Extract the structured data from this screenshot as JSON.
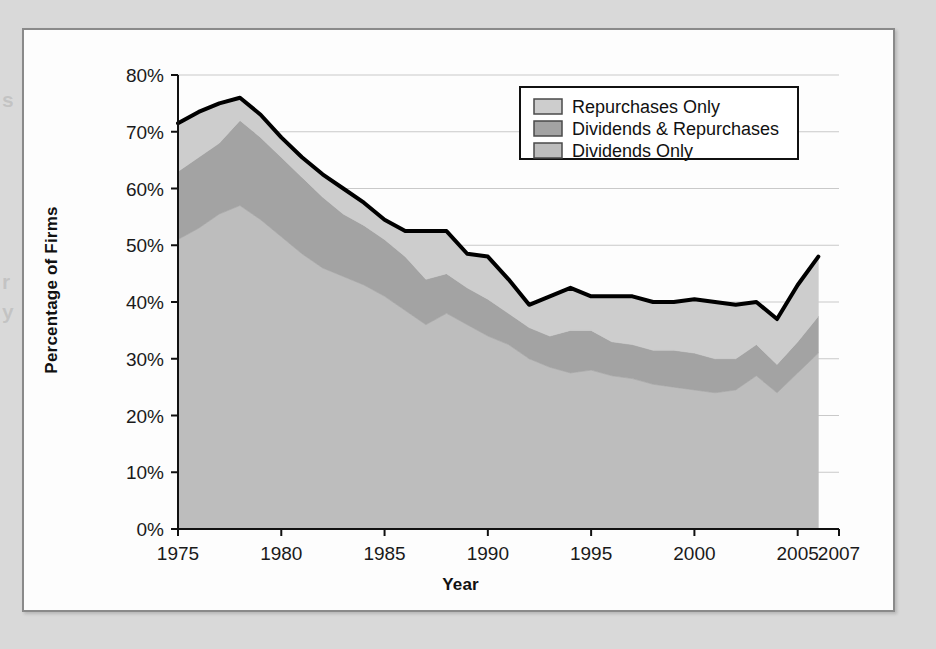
{
  "page": {
    "background_color": "#d9d9d9",
    "panel_background": "#fdfdfd",
    "panel_border_color": "#8a8a8a",
    "bleed_fragments": [
      "s",
      "r",
      "y"
    ]
  },
  "chart_data": {
    "type": "area",
    "stacked": true,
    "title": "",
    "xlabel": "Year",
    "ylabel": "Percentage of Firms",
    "xlim": [
      1975,
      2007
    ],
    "ylim": [
      0,
      80
    ],
    "y_tick_suffix": "%",
    "grid": true,
    "grid_orientation": "horizontal",
    "legend_position": "top-right-inside",
    "x": [
      1975,
      1976,
      1977,
      1978,
      1979,
      1980,
      1981,
      1982,
      1983,
      1984,
      1985,
      1986,
      1987,
      1988,
      1989,
      1990,
      1991,
      1992,
      1993,
      1994,
      1995,
      1996,
      1997,
      1998,
      1999,
      2000,
      2001,
      2002,
      2003,
      2004,
      2005,
      2006
    ],
    "x_ticks": [
      1975,
      1980,
      1985,
      1990,
      1995,
      2000,
      2005,
      2007
    ],
    "x_tick_labels": [
      "1975",
      "1980",
      "1985",
      "1990",
      "1995",
      "2000",
      "2005",
      "2007"
    ],
    "y_ticks": [
      0,
      10,
      20,
      30,
      40,
      50,
      60,
      70,
      80
    ],
    "y_tick_labels": [
      "0%",
      "10%",
      "20%",
      "30%",
      "40%",
      "50%",
      "60%",
      "70%",
      "80%"
    ],
    "series": [
      {
        "name": "Dividends Only",
        "color": "#bdbdbd",
        "order": 1,
        "values": [
          51.0,
          53.0,
          55.5,
          57.0,
          54.5,
          51.5,
          48.5,
          46.0,
          44.5,
          43.0,
          41.0,
          38.5,
          36.0,
          38.0,
          36.0,
          34.0,
          32.5,
          30.0,
          28.5,
          27.5,
          28.0,
          27.0,
          26.5,
          25.5,
          25.0,
          24.5,
          24.0,
          24.5,
          27.0,
          24.0,
          27.5,
          31.0
        ]
      },
      {
        "name": "Dividends & Repurchases",
        "color": "#a3a3a3",
        "order": 2,
        "values": [
          12.0,
          12.5,
          12.5,
          15.0,
          14.5,
          14.0,
          13.5,
          12.5,
          11.0,
          10.5,
          10.0,
          9.5,
          8.0,
          7.0,
          6.5,
          6.5,
          5.5,
          5.5,
          5.5,
          7.5,
          7.0,
          6.0,
          6.0,
          6.0,
          6.5,
          6.5,
          6.0,
          5.5,
          5.5,
          5.0,
          5.5,
          6.5
        ]
      },
      {
        "name": "Repurchases Only",
        "color": "#cdcdcd",
        "order": 3,
        "values": [
          8.5,
          8.0,
          7.0,
          4.0,
          4.0,
          3.5,
          3.5,
          4.0,
          4.5,
          4.0,
          3.5,
          4.5,
          8.5,
          7.5,
          6.0,
          7.5,
          6.0,
          4.0,
          7.0,
          7.5,
          6.0,
          8.0,
          8.5,
          8.5,
          8.5,
          9.5,
          10.0,
          9.5,
          7.5,
          8.0,
          10.0,
          10.5
        ]
      }
    ],
    "total_line": {
      "name": "Total payers",
      "color": "#000000",
      "width": 4,
      "values": [
        71.5,
        73.5,
        75.0,
        76.0,
        73.0,
        69.0,
        65.5,
        62.5,
        60.0,
        57.5,
        54.5,
        52.5,
        52.5,
        52.5,
        48.5,
        48.0,
        44.0,
        39.5,
        41.0,
        42.5,
        41.0,
        41.0,
        41.0,
        40.0,
        40.0,
        40.5,
        40.0,
        39.5,
        40.0,
        37.0,
        43.0,
        48.0
      ]
    }
  },
  "legend": {
    "items": [
      {
        "label": "Repurchases Only",
        "swatch_color": "#cdcdcd"
      },
      {
        "label": "Dividends & Repurchases",
        "swatch_color": "#a3a3a3"
      },
      {
        "label": "Dividends Only",
        "swatch_color": "#bdbdbd"
      }
    ]
  },
  "axis": {
    "x_title": "Year",
    "y_title": "Percentage of Firms"
  }
}
